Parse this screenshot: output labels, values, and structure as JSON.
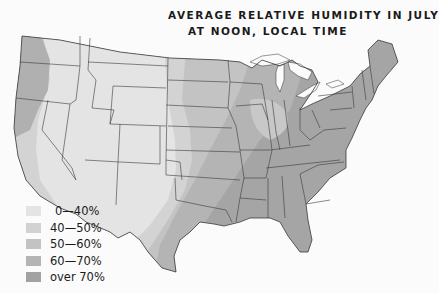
{
  "title": {
    "line1": "AVERAGE RELATIVE HUMIDITY IN JULY",
    "line2": "AT NOON, LOCAL TIME"
  },
  "legend": {
    "items": [
      {
        "label": "0—40%",
        "color": "#e4e4e4"
      },
      {
        "label": "40—50%",
        "color": "#d2d2d2"
      },
      {
        "label": "50—60%",
        "color": "#c3c3c3"
      },
      {
        "label": "60—70%",
        "color": "#b4b4b4"
      },
      {
        "label": "over 70%",
        "color": "#a2a2a2"
      }
    ]
  },
  "map": {
    "region": "United States (contiguous)",
    "zones": [
      {
        "area": "Desert Southwest, Great Basin, Rockies, High Plains",
        "range": "0—40%"
      },
      {
        "area": "Pacific coast strip, western Great Plains",
        "range": "40—50%"
      },
      {
        "area": "Central Plains, Upper Midwest, Ohio Valley",
        "range": "50—60%"
      },
      {
        "area": "Northeast, Great Lakes, mid-South",
        "range": "60—70%"
      },
      {
        "area": "Gulf Coast, Southeast, Florida, Pacific Northwest coast",
        "range": "over 70%"
      }
    ]
  }
}
